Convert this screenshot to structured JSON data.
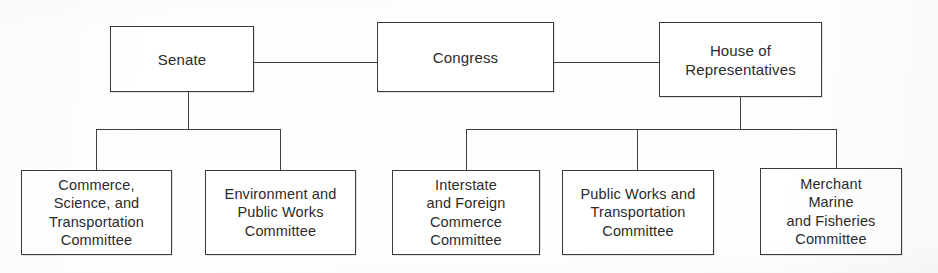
{
  "diagram": {
    "line_color": "#3f3f3f",
    "box_border_color": "#3a3a3a",
    "background_color": "#ffffff",
    "text_color": "#2b2b2b"
  },
  "nodes": {
    "congress": {
      "label": "Congress"
    },
    "senate": {
      "label": "Senate"
    },
    "house": {
      "label": "House of\nRepresentatives"
    },
    "senate_committees": [
      {
        "label": "Commerce,\nScience, and\nTransportation\nCommittee"
      },
      {
        "label": "Environment and\nPublic Works\nCommittee"
      }
    ],
    "house_committees": [
      {
        "label": "Interstate\nand Foreign\nCommerce\nCommittee"
      },
      {
        "label": "Public Works and\nTransportation\nCommittee"
      },
      {
        "label": "Merchant\nMarine\nand Fisheries\nCommittee"
      }
    ]
  }
}
